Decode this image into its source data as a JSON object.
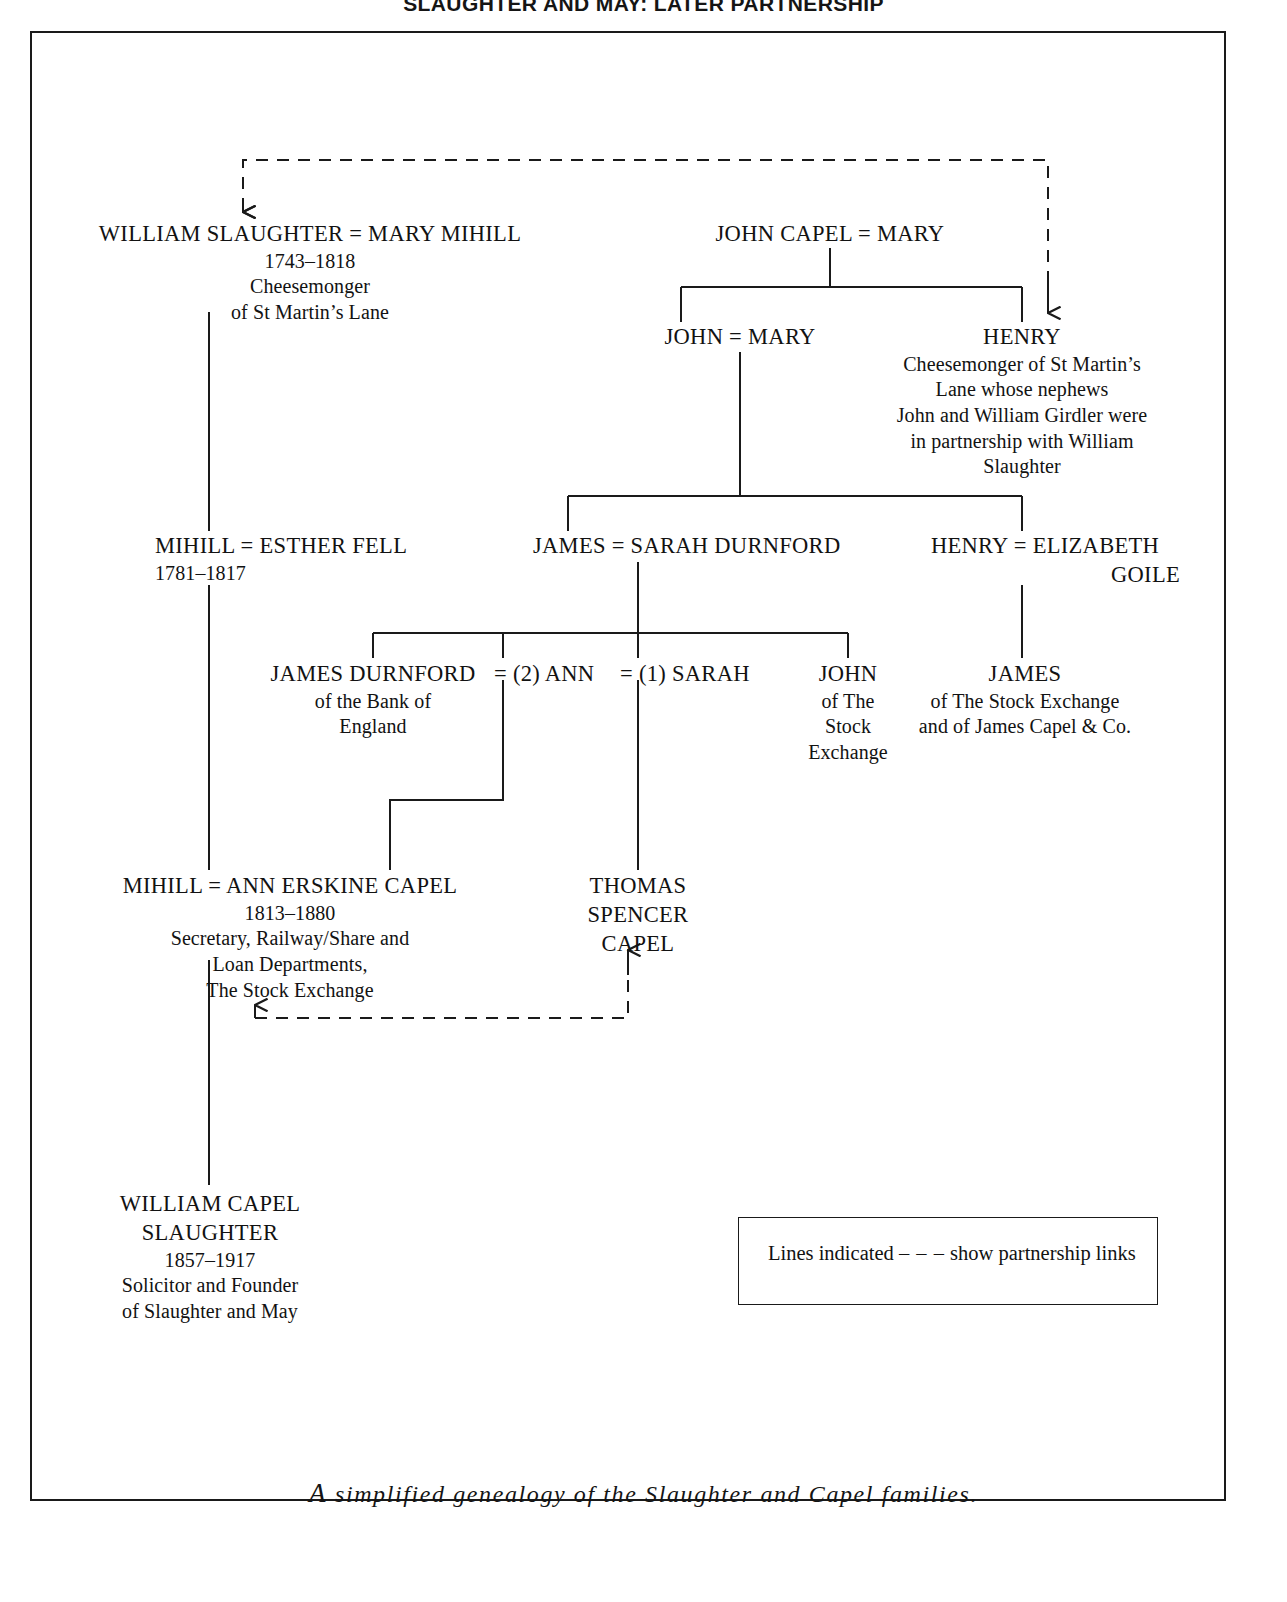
{
  "running_header": "SLAUGHTER AND MAY: LATER PARTNERSHIP",
  "caption": {
    "lead": "A",
    "rest": "simplified  genealogy  of  the  Slaughter  and  Capel  families."
  },
  "legend": {
    "before": "Lines indicated",
    "dash": "– – –",
    "after": "show partnership links"
  },
  "colors": {
    "ink": "#121212",
    "rule": "#1a1a1a",
    "paper": "#ffffff"
  },
  "nodes": {
    "william_slaughter": {
      "name": "WILLIAM SLAUGHTER  =  MARY MIHILL",
      "dates": "1743–1818",
      "desc_1": "Cheesemonger",
      "desc_2": "of St Martin’s Lane"
    },
    "john_capel": {
      "name": "JOHN CAPEL  =  MARY"
    },
    "john_mary": {
      "name": "JOHN = MARY"
    },
    "henry_cheesemonger": {
      "name": "HENRY",
      "desc_1": "Cheesemonger of St Martin’s",
      "desc_2": "Lane whose nephews",
      "desc_3": "John and William Girdler were",
      "desc_4": "in partnership with William",
      "desc_5": "Slaughter"
    },
    "mihill_esther": {
      "name": "MIHILL = ESTHER FELL",
      "dates": "1781–1817"
    },
    "james_sarah": {
      "name": "JAMES = SARAH DURNFORD"
    },
    "henry_elizabeth": {
      "name_1": "HENRY = ELIZABETH",
      "name_2": "GOILE"
    },
    "james_durnford": {
      "name": "JAMES DURNFORD",
      "desc_1": "of the Bank of",
      "desc_2": "England"
    },
    "ann_second": {
      "name": "=  (2) ANN"
    },
    "sarah_first": {
      "name": "=  (1) SARAH"
    },
    "john_stock_exchange": {
      "name": "JOHN",
      "desc_1": "of The",
      "desc_2": "Stock",
      "desc_3": "Exchange"
    },
    "james_stock_exchange": {
      "name": "JAMES",
      "desc_1": "of The Stock Exchange",
      "desc_2": "and of James Capel & Co."
    },
    "mihill_ann": {
      "name": "MIHILL   =  ANN ERSKINE CAPEL",
      "dates": "1813–1880",
      "desc_1": "Secretary, Railway/Share and",
      "desc_2": "Loan Departments,",
      "desc_3": "The Stock Exchange"
    },
    "thomas_spencer_capel": {
      "name_1": "THOMAS",
      "name_2": "SPENCER",
      "name_3": "CAPEL"
    },
    "william_capel_slaughter": {
      "name_1": "WILLIAM CAPEL",
      "name_2": "SLAUGHTER",
      "dates": "1857–1917",
      "desc_1": "Solicitor and Founder",
      "desc_2": "of Slaughter and May"
    }
  }
}
